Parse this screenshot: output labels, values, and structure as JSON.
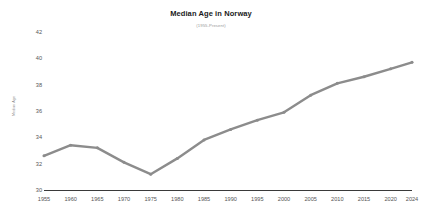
{
  "chart_data": {
    "type": "line",
    "title": "Median Age in Norway",
    "subtitle": "(1955-Present)",
    "xlabel": "",
    "ylabel": "Median Age",
    "x": [
      1955,
      1960,
      1965,
      1970,
      1975,
      1980,
      1985,
      1990,
      1995,
      2000,
      2005,
      2010,
      2015,
      2020,
      2024
    ],
    "values": [
      32.6,
      33.4,
      33.2,
      32.1,
      31.2,
      32.4,
      33.8,
      34.6,
      35.3,
      35.9,
      37.2,
      38.1,
      38.6,
      39.2,
      39.7
    ],
    "series": [
      {
        "name": "Median Age",
        "values": [
          32.6,
          33.4,
          33.2,
          32.1,
          31.2,
          32.4,
          33.8,
          34.6,
          35.3,
          35.9,
          37.2,
          38.1,
          38.6,
          39.2,
          39.7
        ]
      }
    ],
    "xlim": [
      1955,
      2024
    ],
    "ylim": [
      30,
      42
    ],
    "x_tick_labels": [
      "1955",
      "1960",
      "1965",
      "1970",
      "1975",
      "1980",
      "1985",
      "1990",
      "1995",
      "2000",
      "2005",
      "2010",
      "2015",
      "2020",
      "2024"
    ],
    "y_ticks": [
      30,
      32,
      34,
      36,
      38,
      40,
      42
    ],
    "y_tick_labels": [
      "30",
      "32",
      "34",
      "36",
      "38",
      "40",
      "42"
    ],
    "grid": false,
    "legend": false,
    "line_color": "#8c8c8c",
    "marker": "dot",
    "background_color": "#ffffff",
    "axis_color": "#3a3a3a",
    "tick_label_color": "#555555"
  }
}
